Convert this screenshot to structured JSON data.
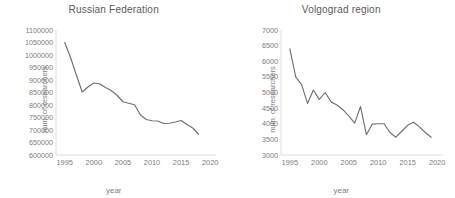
{
  "figure": {
    "background": "#ffffff",
    "line_color": "#707070",
    "axis_color": "#d6d6d6",
    "text_color": "#7d7d7d",
    "title_color": "#5a5a5a"
  },
  "chart_data": [
    {
      "type": "line",
      "title": "Russian Federation",
      "xlabel": "year",
      "ylabel": "num. of researchers",
      "xlim": [
        1993.5,
        2021
      ],
      "ylim": [
        600000,
        1100000
      ],
      "xticks": [
        1995,
        2000,
        2005,
        2010,
        2015,
        2020
      ],
      "yticks": [
        600000,
        650000,
        700000,
        750000,
        800000,
        850000,
        900000,
        950000,
        1000000,
        1050000,
        1100000
      ],
      "grid": false,
      "legend": "none",
      "x": [
        1995,
        1996,
        1997,
        1998,
        1999,
        2000,
        2001,
        2002,
        2003,
        2004,
        2005,
        2006,
        2007,
        2008,
        2009,
        2010,
        2011,
        2012,
        2013,
        2014,
        2015,
        2016,
        2017,
        2018
      ],
      "values": [
        1050000,
        990000,
        920000,
        852000,
        872000,
        888000,
        885000,
        870000,
        858000,
        839000,
        813000,
        807000,
        801000,
        761000,
        742000,
        737000,
        736000,
        726000,
        727000,
        732000,
        738000,
        722000,
        708000,
        683000
      ]
    },
    {
      "type": "line",
      "title": "Volgograd region",
      "xlabel": "year",
      "ylabel": "num. of researchers",
      "xlim": [
        1993.5,
        2021
      ],
      "ylim": [
        3000,
        7000
      ],
      "xticks": [
        1995,
        2000,
        2005,
        2010,
        2015,
        2020
      ],
      "yticks": [
        3000,
        3500,
        4000,
        4500,
        5000,
        5500,
        6000,
        6500,
        7000
      ],
      "grid": false,
      "legend": "none",
      "x": [
        1995,
        1996,
        1997,
        1998,
        1999,
        2000,
        2001,
        2002,
        2003,
        2004,
        2005,
        2006,
        2007,
        2008,
        2009,
        2010,
        2011,
        2012,
        2013,
        2014,
        2015,
        2016,
        2017,
        2018,
        2019
      ],
      "values": [
        6400,
        5500,
        5250,
        4650,
        5080,
        4780,
        5000,
        4700,
        4600,
        4450,
        4250,
        4020,
        4550,
        3650,
        3990,
        4000,
        4000,
        3720,
        3570,
        3760,
        3950,
        4050,
        3900,
        3720,
        3570
      ]
    }
  ]
}
